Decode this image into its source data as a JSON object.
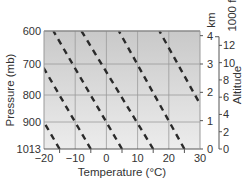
{
  "chart_data": {
    "type": "line",
    "title": "",
    "xlabel": "Temperature (°C)",
    "ylabel": "Pressure (mb)",
    "right_axis_label": "Altitude",
    "right_axis_units": [
      "km",
      "1000 ft"
    ],
    "xlim": [
      -20,
      30
    ],
    "ylim_pressure": [
      1013,
      600
    ],
    "x_ticks": [
      -20,
      -10,
      0,
      10,
      20,
      30
    ],
    "x_minor_ticks": [
      -15,
      -5,
      5,
      15,
      25
    ],
    "y_ticks": [
      "600",
      "700",
      "800",
      "900",
      "1013"
    ],
    "y_tick_values": [
      600,
      700,
      800,
      900,
      1013
    ],
    "km_ticks": [
      "0",
      "1",
      "2",
      "3",
      "4"
    ],
    "km_tick_values": [
      0,
      1,
      2,
      3,
      4
    ],
    "kft_ticks": [
      "0",
      "2",
      "4",
      "6",
      "8",
      "10",
      "12"
    ],
    "kft_tick_values": [
      0,
      2,
      4,
      6,
      8,
      10,
      12
    ],
    "grid": true,
    "background": "gradient gray, darker at top",
    "series": [
      {
        "name": "dashed-line-1",
        "style": "dashed",
        "points": [
          {
            "pressure": 1013,
            "temp": -15
          },
          {
            "pressure": 600,
            "temp": -37
          }
        ]
      },
      {
        "name": "dashed-line-2",
        "style": "dashed",
        "points": [
          {
            "pressure": 1013,
            "temp": -5
          },
          {
            "pressure": 600,
            "temp": -27
          }
        ]
      },
      {
        "name": "dashed-line-3",
        "style": "dashed",
        "points": [
          {
            "pressure": 1013,
            "temp": 5
          },
          {
            "pressure": 600,
            "temp": -17
          }
        ]
      },
      {
        "name": "dashed-line-4",
        "style": "dashed",
        "points": [
          {
            "pressure": 1013,
            "temp": 15
          },
          {
            "pressure": 600,
            "temp": -8
          }
        ]
      },
      {
        "name": "dashed-line-5",
        "style": "dashed",
        "points": [
          {
            "pressure": 1013,
            "temp": 25
          },
          {
            "pressure": 600,
            "temp": 4
          }
        ]
      },
      {
        "name": "dashed-line-6",
        "style": "dashed",
        "points": [
          {
            "pressure": 1013,
            "temp": 38
          },
          {
            "pressure": 600,
            "temp": 17
          }
        ]
      }
    ],
    "colors": {
      "line": "#2a2a2a",
      "grid": "#9a9a9a",
      "axis": "#555555",
      "bg_top": "#c9c9c9",
      "bg_bottom": "#ececec"
    }
  }
}
